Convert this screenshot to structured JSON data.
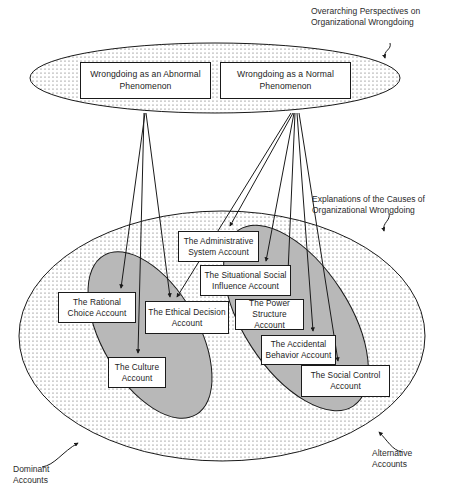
{
  "figure": {
    "title_hidden": "",
    "captions": {
      "overarching": "Overarching Perspectives on\nOrganizational Wrongdoing",
      "explanations": "Explanations of the Causes of\nOrganizational Wrongdoing",
      "dominant": "Dominant\nAccounts",
      "alternative": "Alternative\nAccounts"
    },
    "perspectives": [
      {
        "id": "abnormal",
        "label": "Wrongdoing as an Abnormal\nPhenomenon"
      },
      {
        "id": "normal",
        "label": "Wrongdoing as a Normal\nPhenomenon"
      }
    ],
    "accounts": [
      {
        "id": "administrative-system",
        "label": "The Administrative\nSystem Account",
        "group": "alternative"
      },
      {
        "id": "situational-social-influence",
        "label": "The Situational Social\nInfluence Account",
        "group": "alternative"
      },
      {
        "id": "rational-choice",
        "label": "The Rational\nChoice Account",
        "group": "dominant"
      },
      {
        "id": "ethical-decision",
        "label": "The Ethical Decision\nAccount",
        "group": "dominant"
      },
      {
        "id": "power-structure",
        "label": "The Power\nStructure Account",
        "group": "alternative"
      },
      {
        "id": "culture",
        "label": "The Culture\nAccount",
        "group": "dominant"
      },
      {
        "id": "accidental-behavior",
        "label": "The Accidental\nBehavior Account",
        "group": "alternative"
      },
      {
        "id": "social-control",
        "label": "The Social Control\nAccount",
        "group": "alternative"
      }
    ],
    "colors": {
      "stroke": "#1a1a1a",
      "box_fill": "#ffffff",
      "outer_ellipse_fill": "#ffffff",
      "dotted_pattern": "#5a5a5a",
      "inner_ellipse_fill": "#b8b8b8",
      "text": "#1c1c1c"
    },
    "links": [
      {
        "from": "abnormal",
        "to": "rational-choice"
      },
      {
        "from": "abnormal",
        "to": "ethical-decision"
      },
      {
        "from": "abnormal",
        "to": "culture"
      },
      {
        "from": "normal",
        "to": "administrative-system"
      },
      {
        "from": "normal",
        "to": "situational-social-influence"
      },
      {
        "from": "normal",
        "to": "ethical-decision"
      },
      {
        "from": "normal",
        "to": "power-structure"
      },
      {
        "from": "normal",
        "to": "accidental-behavior"
      },
      {
        "from": "normal",
        "to": "social-control"
      }
    ]
  }
}
